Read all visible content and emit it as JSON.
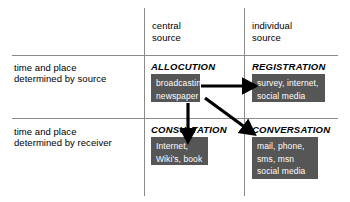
{
  "diagram": {
    "title_text": "",
    "colors": {
      "example_box_fill": "#565656",
      "example_box_text": "#ffffff",
      "grid_line": "#8a8a8a",
      "arrow": "#000000",
      "background": "#ffffff"
    },
    "column_headers": [
      {
        "id": "central",
        "label": "central\nsource"
      },
      {
        "id": "individual",
        "label": "individual\nsource"
      }
    ],
    "row_headers": [
      {
        "id": "by-source",
        "label": "time and place\ndetermined by source"
      },
      {
        "id": "by-receiver",
        "label": "time and place\ndetermined by receiver"
      }
    ],
    "cells": [
      {
        "id": "allocution",
        "title": "ALLOCUTION",
        "examples": "broadcasting,\nnewspaper"
      },
      {
        "id": "registration",
        "title": "REGISTRATION",
        "examples": "survey, internet,\nsocial media"
      },
      {
        "id": "consultation",
        "title": "CONSULTATION",
        "examples": "Internet,\nWiki's, book"
      },
      {
        "id": "conversation",
        "title": "CONVERSATION",
        "examples": "mail, phone,\nsms, msn\nsocial media"
      }
    ],
    "arrows": [
      {
        "id": "allocution-to-registration",
        "from": "allocution",
        "to": "registration",
        "direction": "right"
      },
      {
        "id": "allocution-to-consultation",
        "from": "allocution",
        "to": "consultation",
        "direction": "down"
      },
      {
        "id": "allocution-to-conversation",
        "from": "allocution",
        "to": "conversation",
        "direction": "down-right"
      }
    ]
  }
}
